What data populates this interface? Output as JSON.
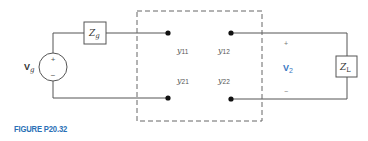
{
  "figure": {
    "caption": "FIGURE P20.32",
    "caption_color": "#2a6fb6"
  },
  "source": {
    "label_main": "V",
    "label_sub": "g",
    "plus": "+",
    "minus": "−"
  },
  "generator_impedance": {
    "label_main": "Z",
    "label_sub": "g"
  },
  "two_port": {
    "params": [
      {
        "main": "y",
        "sub": "11"
      },
      {
        "main": "y",
        "sub": "12"
      },
      {
        "main": "y",
        "sub": "21"
      },
      {
        "main": "y",
        "sub": "22"
      }
    ]
  },
  "output": {
    "plus": "+",
    "minus": "−",
    "voltage_main": "V",
    "voltage_sub": "2",
    "voltage_color": "#3a78c2"
  },
  "load_impedance": {
    "label_main": "Z",
    "label_sub": "L"
  }
}
